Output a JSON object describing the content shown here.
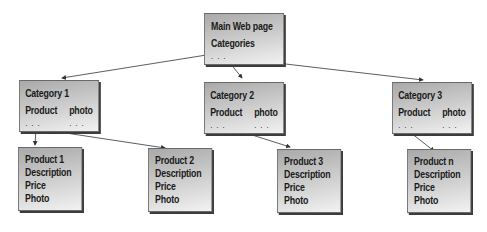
{
  "main": {
    "title": "Main Web page",
    "subtitle": "Categories",
    "dots": ". . ."
  },
  "categories": [
    {
      "title": "Category 1",
      "col1": "Product",
      "col2": "photo",
      "dots1": ". . .",
      "dots2": ". . ."
    },
    {
      "title": "Category 2",
      "col1": "Product",
      "col2": "photo",
      "dots1": ". . .",
      "dots2": ". . ."
    },
    {
      "title": "Category 3",
      "col1": "Product",
      "col2": "photo",
      "dots1": ". . .",
      "dots2": ". . ."
    }
  ],
  "products": [
    {
      "title": "Product 1",
      "l1": "Description",
      "l2": "Price",
      "l3": "Photo"
    },
    {
      "title": "Product 2",
      "l1": "Description",
      "l2": "Price",
      "l3": "Photo"
    },
    {
      "title": "Product 3",
      "l1": "Description",
      "l2": "Price",
      "l3": "Photo"
    },
    {
      "title": "Product n",
      "l1": "Description",
      "l2": "Price",
      "l3": "Photo"
    }
  ],
  "colors": {
    "box_dark": "#a9a9a9",
    "box_light": "#f2f2f2",
    "shadow": "#3c3c3c",
    "arrow": "#333333"
  }
}
